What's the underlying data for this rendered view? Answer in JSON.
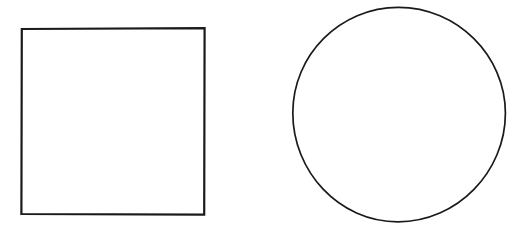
{
  "canvas": {
    "width": 524,
    "height": 229,
    "background_color": "#ffffff",
    "description": "Two hand-drawn black line shapes on a plain white background: a square on the left and a circle on the right. No text or labels are present."
  },
  "shapes": [
    {
      "id": "square",
      "name": "square",
      "icon_name": "square-outline-icon",
      "geometry": {
        "x": 21,
        "y": 28,
        "width": 184,
        "height": 187,
        "center_x": 113,
        "center_y": 121.5
      },
      "style": {
        "stroke_color": "#1a1a1a",
        "stroke_width": 2.2,
        "fill_color": "#ffffff"
      }
    },
    {
      "id": "circle",
      "name": "circle",
      "icon_name": "circle-outline-icon",
      "geometry": {
        "center_x": 399,
        "center_y": 114.5,
        "radius_x": 106,
        "radius_y": 107.5,
        "bounding_box": {
          "left": 293,
          "top": 7,
          "right": 505,
          "bottom": 222
        }
      },
      "style": {
        "stroke_color": "#1a1a1a",
        "stroke_width": 1.7,
        "fill_color": "#ffffff"
      }
    }
  ],
  "colors": {
    "ink": "#1a1a1a",
    "paper": "#ffffff"
  }
}
